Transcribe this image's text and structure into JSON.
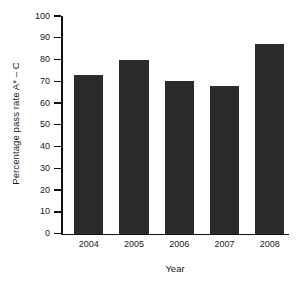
{
  "chart_data": {
    "type": "bar",
    "title": "",
    "xlabel": "Year",
    "ylabel": "Percentage pass rate A* – C",
    "categories": [
      "2004",
      "2005",
      "2006",
      "2007",
      "2008"
    ],
    "values": [
      73,
      80,
      70,
      68,
      87
    ],
    "ylim": [
      0,
      100
    ],
    "ytick_values": [
      0,
      10,
      20,
      30,
      40,
      50,
      60,
      70,
      80,
      90,
      100
    ],
    "ytick_labels": [
      "0",
      "10",
      "20",
      "30",
      "40",
      "50",
      "60",
      "70",
      "80",
      "90",
      "100"
    ],
    "grid": false,
    "legend": null,
    "bar_color": "#2b2b2b",
    "axis_color": "#111111",
    "background_color": "#ffffff"
  }
}
